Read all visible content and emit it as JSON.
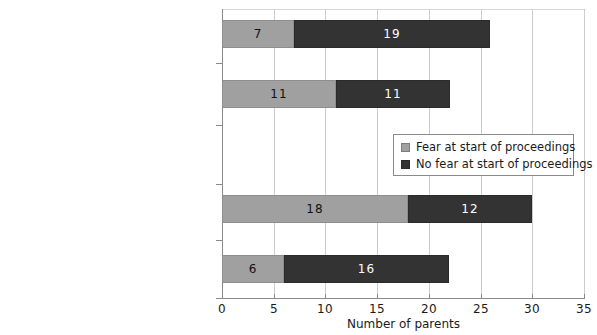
{
  "chart_data": {
    "type": "bar",
    "orientation": "horizontal",
    "stacked": true,
    "title": "",
    "xlabel": "Number of parents",
    "ylabel": "",
    "xlim": [
      0,
      35
    ],
    "xticks": [
      0,
      5,
      10,
      15,
      20,
      25,
      30,
      35
    ],
    "xtick_labels": [
      "0",
      "5",
      "10",
      "15",
      "20",
      "25",
      "30",
      "35"
    ],
    "grid": "vertical",
    "legend_position": "center-right",
    "categories": [
      "Dissatisfied or mainly dissatisfied fathers",
      "Satisfied or mainly satisfied fathers",
      "Dissatisfied or mainly dissatisfied mothers",
      "Satisfied or mainly satisfied mothers"
    ],
    "series": [
      {
        "name": "Fear at start of proceedings",
        "color": "#a0a0a0",
        "values": [
          7,
          11,
          18,
          6
        ]
      },
      {
        "name": "No fear at start of proceedings",
        "color": "#333333",
        "values": [
          19,
          11,
          12,
          16
        ]
      }
    ],
    "totals": [
      26,
      22,
      30,
      22
    ]
  },
  "legend": {
    "items": [
      {
        "label": "Fear at start of proceedings",
        "swatch": "fear"
      },
      {
        "label": "No fear at start of proceedings",
        "swatch": "nofear"
      }
    ]
  },
  "colors": {
    "fear": "#a0a0a0",
    "no_fear": "#333333",
    "axis": "#8a8a8a",
    "grid": "#cccccc",
    "text": "#1a1a1a",
    "background": "#ffffff"
  },
  "geometry": {
    "x0_px": 222,
    "x_max_px": 584,
    "px_per_unit": 10.342,
    "bar_height_px": 28,
    "bar_tops_px": [
      20,
      80,
      195,
      255
    ],
    "plot_top_px": 9,
    "plot_bottom_px": 298
  }
}
